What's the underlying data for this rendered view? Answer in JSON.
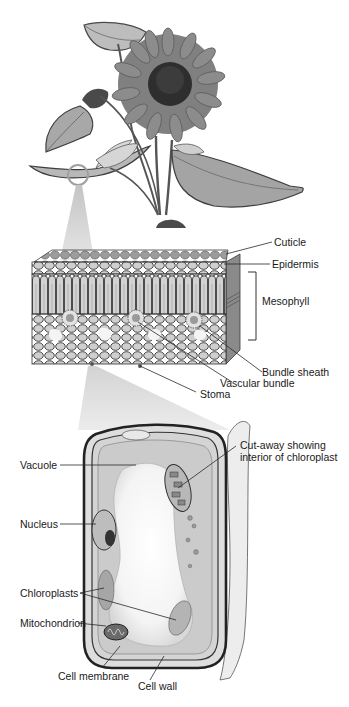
{
  "figure": {
    "panels": [
      {
        "id": "plant",
        "name": "Sunflower plant"
      },
      {
        "id": "leaf_section",
        "name": "Leaf cross-section"
      },
      {
        "id": "cell",
        "name": "Plant cell"
      }
    ],
    "colors": {
      "background": "#ffffff",
      "ink": "#1a1a1a",
      "leaf_dark": "#5a5a5a",
      "leaf_mid": "#8a8a8a",
      "petal": "#7a7a7a",
      "disc": "#2a2a2a",
      "callout": "#c8c8c8",
      "magnifier": "#a0a0a0"
    }
  },
  "leaf_labels": {
    "cuticle": "Cuticle",
    "epidermis": "Epidermis",
    "mesophyll": "Mesophyll",
    "bundle_sheath": "Bundle sheath",
    "vascular_bundle": "Vascular bundle",
    "stoma": "Stoma"
  },
  "cell_labels": {
    "cutaway": "Cut-away showing interior of chloroplast",
    "vacuole": "Vacuole",
    "nucleus": "Nucleus",
    "chloroplasts": "Chloroplasts",
    "mitochondrion": "Mitochondrion",
    "cell_membrane": "Cell membrane",
    "cell_wall": "Cell wall"
  }
}
